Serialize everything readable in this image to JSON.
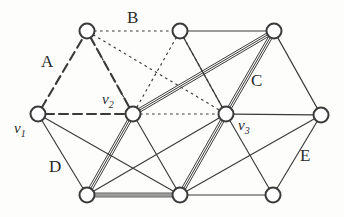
{
  "figure": {
    "type": "graph-diagram",
    "width": 344,
    "height": 217,
    "background_color": "#fdfdfc",
    "ink_color": "#3a3a3a"
  },
  "vertices": [
    {
      "id": "p1",
      "name": "top-left-node",
      "x": 87,
      "y": 31,
      "r": 7.5,
      "label": ""
    },
    {
      "id": "p2",
      "name": "top-middle-node",
      "x": 180,
      "y": 31,
      "r": 7.5,
      "label": ""
    },
    {
      "id": "p3",
      "name": "top-right-node",
      "x": 274,
      "y": 31,
      "r": 7.5,
      "label": ""
    },
    {
      "id": "v1",
      "name": "vertex-v1",
      "x": 38,
      "y": 114,
      "r": 7.5,
      "label": "v1"
    },
    {
      "id": "v2",
      "name": "vertex-v2",
      "x": 133,
      "y": 114,
      "r": 7.5,
      "label": "v2"
    },
    {
      "id": "v3",
      "name": "vertex-v3",
      "x": 226,
      "y": 114,
      "r": 7.5,
      "label": "v3"
    },
    {
      "id": "p7",
      "name": "right-node",
      "x": 321,
      "y": 115,
      "r": 7.5,
      "label": ""
    },
    {
      "id": "p8",
      "name": "bottom-left-node",
      "x": 87,
      "y": 195,
      "r": 7.5,
      "label": ""
    },
    {
      "id": "p9",
      "name": "bottom-middle-node",
      "x": 180,
      "y": 195,
      "r": 7.5,
      "label": ""
    },
    {
      "id": "p10",
      "name": "bottom-right-node",
      "x": 273,
      "y": 195,
      "r": 7.5,
      "label": ""
    }
  ],
  "edges": [
    {
      "from": "v1",
      "to": "p1",
      "style": "dashed",
      "weight": 1,
      "region": "A"
    },
    {
      "from": "p1",
      "to": "v2",
      "style": "dashed",
      "weight": 1,
      "region": "A"
    },
    {
      "from": "v1",
      "to": "v2",
      "style": "dashed",
      "weight": 1,
      "region": "A"
    },
    {
      "from": "p1",
      "to": "p2",
      "style": "dotted",
      "weight": 1,
      "region": "B"
    },
    {
      "from": "p1",
      "to": "v2",
      "style": "dotted",
      "weight": 1,
      "region": "B"
    },
    {
      "from": "p1",
      "to": "v3",
      "style": "dotted",
      "weight": 1,
      "region": "B"
    },
    {
      "from": "p2",
      "to": "v2",
      "style": "dotted",
      "weight": 1,
      "region": "B"
    },
    {
      "from": "p2",
      "to": "v3",
      "style": "dotted",
      "weight": 1,
      "region": "B"
    },
    {
      "from": "v2",
      "to": "v3",
      "style": "dotted",
      "weight": 1,
      "region": "B"
    },
    {
      "from": "p2",
      "to": "p3",
      "style": "solid",
      "weight": 1,
      "region": "C"
    },
    {
      "from": "p2",
      "to": "v3",
      "style": "solid",
      "weight": 1,
      "region": "C"
    },
    {
      "from": "v2",
      "to": "p3",
      "style": "solid",
      "weight": 3,
      "region": "C"
    },
    {
      "from": "v3",
      "to": "p3",
      "style": "solid",
      "weight": 3,
      "region": "C"
    },
    {
      "from": "v1",
      "to": "p8",
      "style": "solid",
      "weight": 1,
      "region": "D"
    },
    {
      "from": "v1",
      "to": "p9",
      "style": "solid",
      "weight": 1,
      "region": "D"
    },
    {
      "from": "v2",
      "to": "p8",
      "style": "solid",
      "weight": 3,
      "region": "D"
    },
    {
      "from": "v2",
      "to": "p9",
      "style": "solid",
      "weight": 1,
      "region": "D"
    },
    {
      "from": "p8",
      "to": "p9",
      "style": "solid",
      "weight": 3,
      "region": "D"
    },
    {
      "from": "p8",
      "to": "v3",
      "style": "solid",
      "weight": 1,
      "region": "D"
    },
    {
      "from": "v3",
      "to": "p9",
      "style": "solid",
      "weight": 3,
      "region": "E"
    },
    {
      "from": "v3",
      "to": "p10",
      "style": "solid",
      "weight": 1,
      "region": "E"
    },
    {
      "from": "v3",
      "to": "p7",
      "style": "solid",
      "weight": 1,
      "region": "E"
    },
    {
      "from": "p9",
      "to": "p10",
      "style": "solid",
      "weight": 1,
      "region": "E"
    },
    {
      "from": "p9",
      "to": "p7",
      "style": "solid",
      "weight": 1,
      "region": "E"
    },
    {
      "from": "p10",
      "to": "p7",
      "style": "solid",
      "weight": 1,
      "region": "E"
    },
    {
      "from": "p3",
      "to": "p7",
      "style": "solid",
      "weight": 1,
      "region": "C"
    }
  ],
  "region_labels": [
    {
      "id": "A",
      "text": "A",
      "x": 41,
      "y": 53
    },
    {
      "id": "B",
      "text": "B",
      "x": 127,
      "y": 9
    },
    {
      "id": "C",
      "text": "C",
      "x": 251,
      "y": 72
    },
    {
      "id": "D",
      "text": "D",
      "x": 49,
      "y": 158
    },
    {
      "id": "E",
      "text": "E",
      "x": 300,
      "y": 147
    }
  ],
  "vertex_labels": [
    {
      "id": "v1",
      "base": "v",
      "sub": "1",
      "x": 14,
      "y": 121
    },
    {
      "id": "v2",
      "base": "v",
      "sub": "2",
      "x": 102,
      "y": 92
    },
    {
      "id": "v3",
      "base": "v",
      "sub": "3",
      "x": 238,
      "y": 118
    }
  ]
}
